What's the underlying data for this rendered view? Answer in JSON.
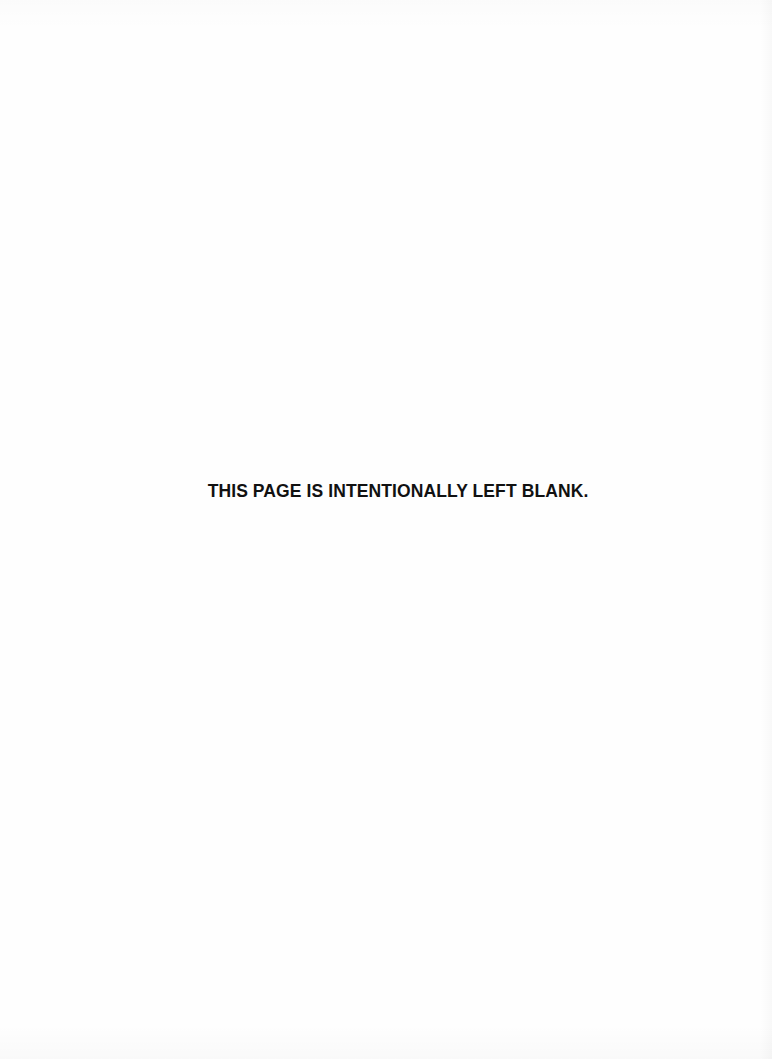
{
  "page": {
    "notice_text": "THIS PAGE IS INTENTIONALLY LEFT BLANK."
  }
}
